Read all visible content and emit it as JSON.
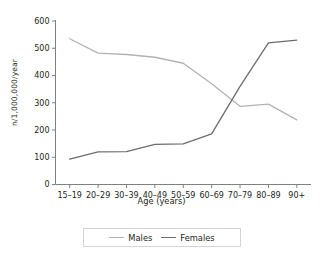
{
  "chart_data": {
    "type": "line",
    "title": "",
    "subtitle": "",
    "xlabel": "Age (years)",
    "ylabel": "n/1,000,000/year",
    "categories": [
      "15–19",
      "20–29",
      "30–39",
      "40–49",
      "50–59",
      "60–69",
      "70–79",
      "80–89",
      "90+"
    ],
    "series": [
      {
        "name": "Males",
        "color": "#b3b3b3",
        "values": [
          535,
          482,
          477,
          467,
          445,
          370,
          287,
          295,
          237
        ]
      },
      {
        "name": "Females",
        "color": "#6d6d6d",
        "values": [
          93,
          120,
          121,
          147,
          149,
          186,
          360,
          520,
          530
        ]
      }
    ],
    "ylim": [
      0,
      600
    ],
    "yticks": [
      0,
      100,
      200,
      300,
      400,
      500,
      600
    ],
    "ytick_labels": [
      "0",
      "100",
      "200",
      "300",
      "400",
      "500",
      "600"
    ],
    "grid": false,
    "legend_position": "bottom-center"
  },
  "axes": {
    "y_title": "n/1,000,000/year",
    "x_title": "Age (years)"
  },
  "legend": {
    "entries": [
      {
        "label": "Males",
        "color": "#b3b3b3"
      },
      {
        "label": "Females",
        "color": "#6d6d6d"
      }
    ]
  },
  "colors": {
    "males_line": "#b3b3b3",
    "females_line": "#6d6d6d",
    "axis": "#808080",
    "text": "#231f20",
    "legend_border": "#d4d4d4",
    "background": "#ffffff"
  }
}
